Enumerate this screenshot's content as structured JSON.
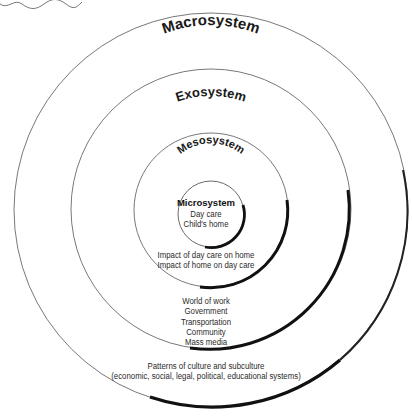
{
  "diagram": {
    "type": "concentric-circles",
    "layers": [
      {
        "name": "Macrosystem",
        "items": [
          "Patterns of culture and subculture",
          "(economic, social, legal, political, educational systems)"
        ]
      },
      {
        "name": "Exosystem",
        "items": [
          "World of work",
          "Government",
          "Transportation",
          "Community",
          "Mass media"
        ]
      },
      {
        "name": "Mesosystem",
        "items": [
          "Impact of day care on home",
          "Impact of home on day care"
        ]
      },
      {
        "name": "Microsystem",
        "items": [
          "Day care",
          "Child's home"
        ]
      }
    ]
  }
}
